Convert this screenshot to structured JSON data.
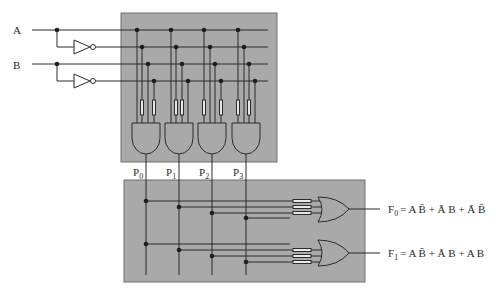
{
  "colors": {
    "panel": "#a9a9a9",
    "panel_border": "#6e6e6e",
    "wire": "#2b2b2b",
    "dot": "#1e1e1e",
    "fuse": "#e8e8e8",
    "background": "#ffffff"
  },
  "inputs": [
    {
      "label": "A",
      "y": 30
    },
    {
      "label": "B",
      "y": 64
    }
  ],
  "product_terms": [
    {
      "label": "P",
      "sub": "0",
      "x": 146,
      "expr": "A·B̄"
    },
    {
      "label": "P",
      "sub": "1",
      "x": 179,
      "expr": "Ā·B"
    },
    {
      "label": "P",
      "sub": "2",
      "x": 212,
      "expr": "Ā·B̄"
    },
    {
      "label": "P",
      "sub": "3",
      "x": 246,
      "expr": "A·B"
    }
  ],
  "outputs": [
    {
      "name": "F",
      "sub": "0",
      "rhs": "= A B̄ + Ā B + Ā B̄",
      "y": 209
    },
    {
      "name": "F",
      "sub": "1",
      "rhs": "= A B̄ + Ā B + A B",
      "y": 253
    }
  ],
  "and_array_fuses": [
    [
      1,
      3
    ],
    [
      1,
      2
    ],
    [
      0,
      3
    ],
    [
      0,
      2
    ]
  ],
  "or_array_fuses": [
    [
      0,
      1,
      2
    ],
    [
      1,
      2,
      3
    ]
  ]
}
